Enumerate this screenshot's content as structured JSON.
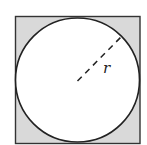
{
  "figure": {
    "shape_square": {
      "x": 15,
      "y": 16,
      "size": 125,
      "fill": "#d9d9d9",
      "stroke": "#333333"
    },
    "shape_circle": {
      "cx": 77.5,
      "cy": 80,
      "r": 62,
      "fill": "#ffffff",
      "stroke": "#222222"
    },
    "radius_label": "r",
    "radius_style": "dashed"
  }
}
